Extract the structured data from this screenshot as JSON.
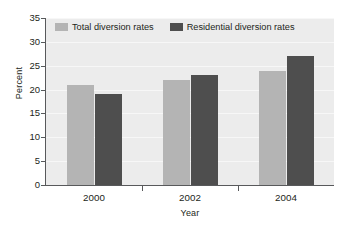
{
  "chart_data": {
    "type": "bar",
    "title": "",
    "xlabel": "Year",
    "ylabel": "Percent",
    "categories": [
      "2000",
      "2002",
      "2004"
    ],
    "series": [
      {
        "name": "Total diversion rates",
        "color": "#b4b4b4",
        "values": [
          21,
          22,
          24
        ]
      },
      {
        "name": "Residential diversion rates",
        "color": "#4e4e4e",
        "values": [
          19,
          23,
          27
        ]
      }
    ],
    "ylim": [
      0,
      35
    ],
    "ytick_step": 5,
    "yticks": [
      "0",
      "5",
      "10",
      "15",
      "20",
      "25",
      "30",
      "35"
    ],
    "grid": "horizontal",
    "legend_position": "top-inside-left",
    "plot_background": "#ececec",
    "axis_color": "#58595b"
  },
  "legend": {
    "entries": [
      {
        "label": "Total diversion rates"
      },
      {
        "label": "Residential diversion rates"
      }
    ]
  }
}
